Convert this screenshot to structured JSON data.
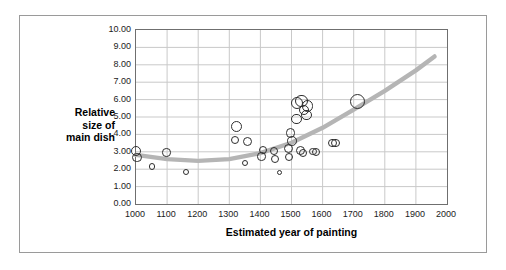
{
  "chart_data": {
    "type": "scatter",
    "title": "",
    "xlabel": "Estimated year of painting",
    "ylabel": "Relative size of main dish",
    "ylabel_lines": [
      "Relative",
      "size of",
      "main dish"
    ],
    "xlim": [
      1000,
      2000
    ],
    "ylim": [
      0.0,
      10.0
    ],
    "xticks": [
      1000,
      1100,
      1200,
      1300,
      1400,
      1500,
      1600,
      1700,
      1800,
      1900,
      2000
    ],
    "xtick_labels": [
      "1000",
      "1100",
      "1200",
      "1300",
      "1400",
      "1500",
      "1600",
      "1700",
      "1800",
      "1900",
      "2000"
    ],
    "yticks": [
      0.0,
      1.0,
      2.0,
      3.0,
      4.0,
      5.0,
      6.0,
      7.0,
      8.0,
      9.0,
      10.0
    ],
    "ytick_labels": [
      "0.00",
      "1.00",
      "2.00",
      "3.00",
      "4.00",
      "5.00",
      "6.00",
      "7.00",
      "8.00",
      "9.00",
      "10.00"
    ],
    "grid": true,
    "grid_x": true,
    "grid_y": true,
    "legend": false,
    "marker_style": "open-circle",
    "marker_edge_color": "#2e2e2e",
    "marker_fill": "none",
    "points": [
      {
        "x": 1000,
        "y": 3.02,
        "r": 5.0
      },
      {
        "x": 1003,
        "y": 2.68,
        "r": 4.6
      },
      {
        "x": 1052,
        "y": 2.15,
        "r": 3.1
      },
      {
        "x": 1098,
        "y": 2.95,
        "r": 4.2
      },
      {
        "x": 1160,
        "y": 1.85,
        "r": 3.0
      },
      {
        "x": 1322,
        "y": 4.45,
        "r": 5.6
      },
      {
        "x": 1318,
        "y": 3.68,
        "r": 4.3
      },
      {
        "x": 1358,
        "y": 3.58,
        "r": 4.6
      },
      {
        "x": 1350,
        "y": 2.38,
        "r": 3.0
      },
      {
        "x": 1408,
        "y": 3.1,
        "r": 4.2
      },
      {
        "x": 1404,
        "y": 2.72,
        "r": 4.2
      },
      {
        "x": 1444,
        "y": 3.05,
        "r": 4.2
      },
      {
        "x": 1448,
        "y": 2.6,
        "r": 4.0
      },
      {
        "x": 1462,
        "y": 1.8,
        "r": 2.6
      },
      {
        "x": 1490,
        "y": 3.18,
        "r": 4.6
      },
      {
        "x": 1492,
        "y": 2.7,
        "r": 4.4
      },
      {
        "x": 1498,
        "y": 4.08,
        "r": 4.6
      },
      {
        "x": 1502,
        "y": 3.62,
        "r": 4.8
      },
      {
        "x": 1518,
        "y": 5.78,
        "r": 6.0
      },
      {
        "x": 1532,
        "y": 5.92,
        "r": 6.2
      },
      {
        "x": 1540,
        "y": 5.4,
        "r": 5.4
      },
      {
        "x": 1552,
        "y": 5.62,
        "r": 5.8
      },
      {
        "x": 1549,
        "y": 5.12,
        "r": 5.4
      },
      {
        "x": 1516,
        "y": 4.9,
        "r": 5.2
      },
      {
        "x": 1528,
        "y": 3.08,
        "r": 4.6
      },
      {
        "x": 1538,
        "y": 2.92,
        "r": 4.0
      },
      {
        "x": 1568,
        "y": 3.02,
        "r": 3.9
      },
      {
        "x": 1580,
        "y": 2.98,
        "r": 4.0
      },
      {
        "x": 1632,
        "y": 3.52,
        "r": 4.2
      },
      {
        "x": 1642,
        "y": 3.5,
        "r": 4.2
      },
      {
        "x": 1712,
        "y": 5.9,
        "r": 7.6
      }
    ],
    "trendline": {
      "present": true,
      "style": "quadratic-fit",
      "color": "#b5b5b5",
      "width_px": 4.4,
      "x_start": 1000,
      "x_end": 1960,
      "samples": [
        {
          "x": 1000,
          "y": 2.82
        },
        {
          "x": 1100,
          "y": 2.58
        },
        {
          "x": 1200,
          "y": 2.48
        },
        {
          "x": 1300,
          "y": 2.58
        },
        {
          "x": 1400,
          "y": 2.92
        },
        {
          "x": 1500,
          "y": 3.52
        },
        {
          "x": 1600,
          "y": 4.38
        },
        {
          "x": 1700,
          "y": 5.42
        },
        {
          "x": 1800,
          "y": 6.5
        },
        {
          "x": 1900,
          "y": 7.68
        },
        {
          "x": 1960,
          "y": 8.48
        }
      ]
    },
    "colors": {
      "frame_border": "#9a9a9a",
      "axis": "#6f6f6f",
      "grid": "#c9c9c9",
      "text": "#1b1b1b",
      "trend": "#b5b5b5",
      "background": "#ffffff"
    }
  }
}
